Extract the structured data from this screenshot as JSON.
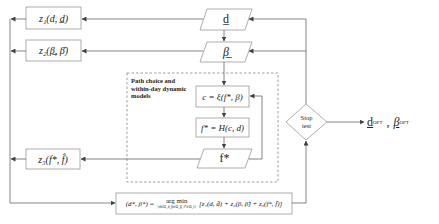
{
  "diagram": {
    "type": "flowchart",
    "title": "",
    "nodes": {
      "z1": {
        "label": "z₁(d, d̲)",
        "shape": "rectangle"
      },
      "z2": {
        "label": "z₂(β̲, β̄)",
        "shape": "rectangle"
      },
      "z3": {
        "label": "z₃(f*, f̂)",
        "shape": "rectangle"
      },
      "d": {
        "label": "d̲",
        "shape": "parallelogram"
      },
      "beta": {
        "label": "β̲",
        "shape": "parallelogram"
      },
      "c_eq": {
        "label": "c = ξ(f*, β)",
        "shape": "rectangle"
      },
      "f_eq": {
        "label": "f* = H(c, d)",
        "shape": "rectangle"
      },
      "fstar": {
        "label": "f*",
        "shape": "parallelogram"
      },
      "stop": {
        "label_line1": "Stop",
        "label_line2": "test",
        "shape": "diamond"
      },
      "argmin": {
        "label_lhs": "(d*, β*) =",
        "label_op": "arg min",
        "label_op_sub": "{d∈Ω_d, β∈Ω_β, f*∈Ω_f}",
        "label_rhs": "[z₁(d, d̂) + z₂(β, β̂) + z₃(f*, f̂)]",
        "shape": "rectangle"
      },
      "output": {
        "label_d": "d",
        "label_d_sub": "OPT",
        "sep": ",",
        "label_b": "β",
        "label_b_sub": "OPT"
      }
    },
    "group": {
      "label_line1": "Path choice and",
      "label_line2": "within-day dynamic",
      "label_line3": "models",
      "style": "dashed"
    },
    "edges": [
      {
        "from": "d",
        "to": "z1"
      },
      {
        "from": "beta",
        "to": "z2"
      },
      {
        "from": "fstar",
        "to": "z3"
      },
      {
        "from": "d",
        "to": "beta"
      },
      {
        "from": "beta",
        "to": "c_eq"
      },
      {
        "from": "c_eq",
        "to": "f_eq"
      },
      {
        "from": "f_eq",
        "to": "fstar"
      },
      {
        "from": "fstar",
        "to": "c_eq",
        "type": "feedback"
      },
      {
        "from": "z1",
        "to": "argmin"
      },
      {
        "from": "z2",
        "to": "argmin"
      },
      {
        "from": "z3",
        "to": "argmin"
      },
      {
        "from": "argmin",
        "to": "stop"
      },
      {
        "from": "stop",
        "to": "d"
      },
      {
        "from": "stop",
        "to": "beta"
      },
      {
        "from": "stop",
        "to": "output"
      }
    ],
    "colors": {
      "line": "#555555",
      "box_border": "#888888",
      "dashed": "#777777"
    }
  }
}
